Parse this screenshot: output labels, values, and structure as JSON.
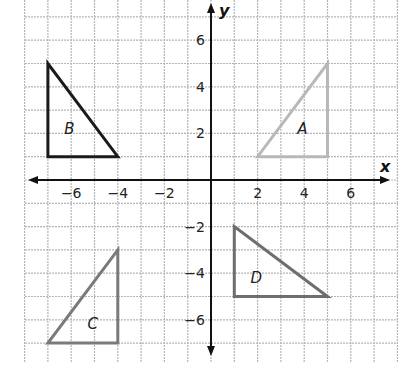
{
  "chart_data": {
    "type": "diagram",
    "title": "",
    "xlabel": "x",
    "ylabel": "y",
    "xlim": [
      -8,
      8
    ],
    "ylim": [
      -8,
      7.7
    ],
    "grid": true,
    "x_ticks": [
      -6,
      -4,
      -2,
      2,
      4,
      6
    ],
    "y_ticks": [
      6,
      4,
      2,
      -2,
      -4,
      -6
    ],
    "shapes": [
      {
        "label": "A",
        "type": "triangle",
        "vertices": [
          [
            2,
            1
          ],
          [
            5,
            1
          ],
          [
            5,
            5
          ]
        ],
        "color": "#b8b8b8",
        "label_pos": [
          4,
          2.2
        ]
      },
      {
        "label": "B",
        "type": "triangle",
        "vertices": [
          [
            -7,
            1
          ],
          [
            -7,
            5
          ],
          [
            -4,
            1
          ]
        ],
        "color": "#1a1a1a",
        "label_pos": [
          -6,
          2.2
        ]
      },
      {
        "label": "C",
        "type": "triangle",
        "vertices": [
          [
            -7,
            -7
          ],
          [
            -4,
            -7
          ],
          [
            -4,
            -3
          ]
        ],
        "color": "#7a7a7a",
        "label_pos": [
          -5,
          -6.2
        ]
      },
      {
        "label": "D",
        "type": "triangle",
        "vertices": [
          [
            1,
            -2
          ],
          [
            1,
            -5
          ],
          [
            5,
            -5
          ]
        ],
        "color": "#6e6e6e",
        "label_pos": [
          2,
          -4.2
        ]
      }
    ]
  },
  "labels": {
    "x_axis": "x",
    "y_axis": "y",
    "x_ticks": [
      "−6",
      "−4",
      "−2",
      "2",
      "4",
      "6"
    ],
    "y_ticks": [
      "6",
      "4",
      "2",
      "−2",
      "−4",
      "−6"
    ],
    "triangles": [
      "A",
      "B",
      "C",
      "D"
    ]
  },
  "colors": {
    "grid": "#b5b5b5",
    "axis": "#111111"
  }
}
